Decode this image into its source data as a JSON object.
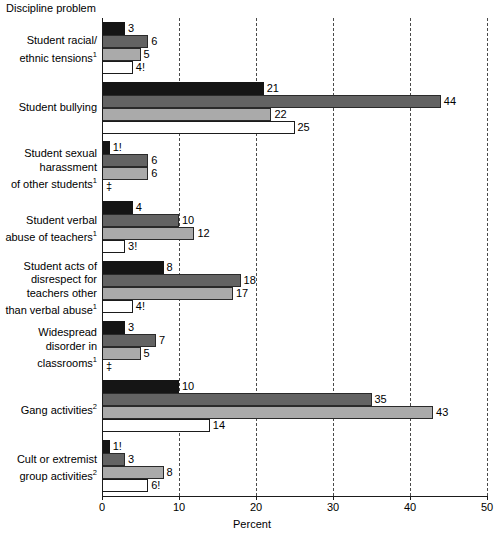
{
  "chart_data": {
    "type": "bar",
    "orientation": "horizontal",
    "title": "Discipline problem",
    "xlabel": "Percent",
    "ylabel": "",
    "xlim": [
      0,
      50
    ],
    "xticks": [
      0,
      10,
      20,
      30,
      40,
      50
    ],
    "xticklabels": [
      "0",
      "10",
      "20",
      "30",
      "40",
      "50"
    ],
    "grid": "vertical-dashed",
    "legend": "none",
    "suppressed_symbol": "‡",
    "unstable_symbol": "!",
    "categories": [
      "Student racial/ ethnic tensions",
      "Student bullying",
      "Student sexual harassment of other students",
      "Student verbal abuse of teachers",
      "Student acts of disrespect for teachers other than verbal abuse",
      "Widespread disorder in classrooms",
      "Gang activities",
      "Cult or extremist group activities"
    ],
    "category_lines": [
      [
        "Student racial/",
        "ethnic tensions"
      ],
      [
        "Student bullying"
      ],
      [
        "Student sexual",
        "harassment",
        "of other students"
      ],
      [
        "Student verbal",
        "abuse of teachers"
      ],
      [
        "Student acts of",
        "disrespect for",
        "teachers other",
        "than verbal abuse"
      ],
      [
        "Widespread",
        "disorder in",
        "classrooms"
      ],
      [
        "Gang activities"
      ],
      [
        "Cult or extremist",
        "group activities"
      ]
    ],
    "category_footnotes": [
      "1",
      "",
      "1",
      "1",
      "1",
      "1",
      "2",
      "2"
    ],
    "series": [
      {
        "name": "series-1",
        "color": "#151515",
        "values": [
          3,
          21,
          1,
          4,
          8,
          3,
          10,
          1
        ],
        "labels": [
          "3",
          "21",
          "1!",
          "4",
          "8",
          "3",
          "10",
          "1!"
        ]
      },
      {
        "name": "series-2",
        "color": "#636363",
        "values": [
          6,
          44,
          6,
          10,
          18,
          7,
          35,
          3
        ],
        "labels": [
          "6",
          "44",
          "6",
          "10",
          "18",
          "7",
          "35",
          "3"
        ]
      },
      {
        "name": "series-3",
        "color": "#aaaaaa",
        "values": [
          5,
          22,
          6,
          12,
          17,
          5,
          43,
          8
        ],
        "labels": [
          "5",
          "22",
          "6",
          "12",
          "17",
          "5",
          "43",
          "8"
        ]
      },
      {
        "name": "series-4",
        "color": "#ffffff",
        "values": [
          4,
          25,
          null,
          3,
          4,
          null,
          14,
          6
        ],
        "labels": [
          "4!",
          "25",
          "‡",
          "3!",
          "4!",
          "‡",
          "14",
          "6!"
        ]
      }
    ]
  }
}
